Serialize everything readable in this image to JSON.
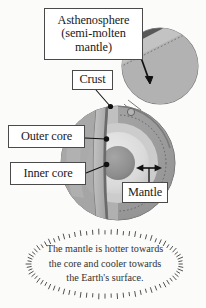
{
  "diagram": {
    "background_color": "#fbfbfa",
    "ink_color": "#333333"
  },
  "labels": {
    "asthenosphere": {
      "line1": "Asthenosphere",
      "line2": "(semi-molten",
      "line3": "mantle)"
    },
    "crust": "Crust",
    "outer_core": "Outer core",
    "inner_core": "Inner core",
    "mantle": "Mantle"
  },
  "caption": {
    "line1": "The mantle is hotter towards",
    "line2": "the core and cooler towards",
    "line3": "the Earth's surface."
  },
  "colors": {
    "sphere_outer": "#9a9a9a",
    "sphere_shadow": "#8f8f8f",
    "mantle_band": "#a8a8a8",
    "mantle_light": "#c4c4c4",
    "outer_core": "#d9d9d9",
    "outer_core_mid": "#cfcfcf",
    "inner_core": "#8e8e8e",
    "crust_dark": "#5c5c5c",
    "cut_face": "#b5b5b5",
    "outline": "#4a4a4a",
    "inset_band": "#585858",
    "inset_fill": "#b0b0b0",
    "label_border": "#4a4a4a",
    "label_bg": "#ffffff"
  },
  "inset": {
    "name": "magnified-crust-detail",
    "arrow": "double-headed thickness arrow"
  }
}
